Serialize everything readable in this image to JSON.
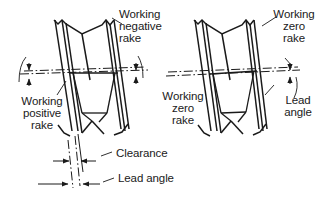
{
  "figure": {
    "type": "engineering-diagram",
    "background_color": "#ffffff",
    "line_color": "#1a1a1a",
    "text_color": "#1a1a1a"
  },
  "labels": {
    "working_negative_rake": {
      "line1": "Working",
      "line2": "negative",
      "line3": "rake"
    },
    "working_positive_rake": {
      "line1": "Working",
      "line2": "positive",
      "line3": "rake"
    },
    "working_zero_rake_right_top": {
      "line1": "Working",
      "line2": "zero",
      "line3": "rake"
    },
    "working_zero_rake_right_mid": {
      "line1": "Working",
      "line2": "zero",
      "line3": "rake"
    },
    "lead_angle_right": {
      "line1": "Lead",
      "line2": "angle"
    },
    "clearance": {
      "line1": "Clearance"
    },
    "lead_angle_bottom": {
      "line1": "Lead angle"
    }
  },
  "views": {
    "left": {
      "name": "Left tool view",
      "description": "Tool with working negative rake on one flank and working positive rake on the other"
    },
    "right": {
      "name": "Right tool view",
      "description": "Tool with working zero rake on both flanks and lead angle shown"
    }
  },
  "annotations": {
    "centerline_style": "dash-dot",
    "angle_arrow_count": 4,
    "dimension_arrow_count": 4
  }
}
